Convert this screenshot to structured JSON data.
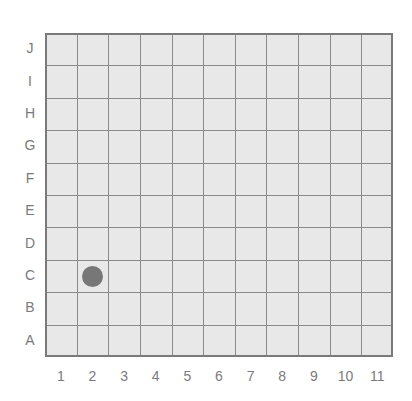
{
  "grid": {
    "columns": [
      "1",
      "2",
      "3",
      "4",
      "5",
      "6",
      "7",
      "8",
      "9",
      "10",
      "11"
    ],
    "rows": [
      "J",
      "I",
      "H",
      "G",
      "F",
      "E",
      "D",
      "C",
      "B",
      "A"
    ],
    "background": "#e8e8e8",
    "line_color": "#8a8a8a"
  },
  "markers": [
    {
      "column": "2",
      "row": "C",
      "color": "#777777",
      "shape": "circle"
    }
  ]
}
